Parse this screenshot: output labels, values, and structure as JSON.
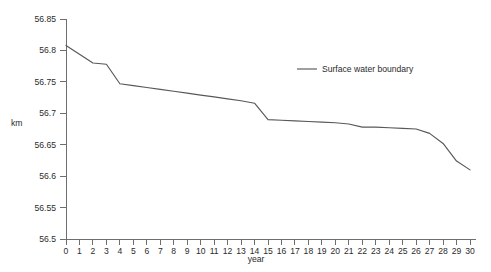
{
  "chart_data": {
    "type": "line",
    "title": "",
    "xlabel": "year",
    "ylabel": "km",
    "xlim": [
      0,
      30
    ],
    "ylim": [
      56.5,
      56.85
    ],
    "grid": false,
    "legend_position": "upper-right-inside",
    "x_ticks": [
      0,
      1,
      2,
      3,
      4,
      5,
      6,
      7,
      8,
      9,
      10,
      11,
      12,
      13,
      14,
      15,
      16,
      17,
      18,
      19,
      20,
      21,
      22,
      23,
      24,
      25,
      26,
      27,
      28,
      29,
      30
    ],
    "x_tick_labels": [
      "0",
      "1",
      "2",
      "3",
      "4",
      "5",
      "6",
      "7",
      "8",
      "9",
      "10",
      "11",
      "12",
      "13",
      "14",
      "15",
      "16",
      "17",
      "18",
      "19",
      "20",
      "21",
      "22",
      "23",
      "24",
      "25",
      "26",
      "27",
      "28",
      "29",
      "30"
    ],
    "y_ticks": [
      56.5,
      56.55,
      56.6,
      56.65,
      56.7,
      56.75,
      56.8,
      56.85
    ],
    "y_tick_labels": [
      "56.5",
      "56.55",
      "56.6",
      "56.65",
      "56.7",
      "56.75",
      "56.8",
      "56.85"
    ],
    "series": [
      {
        "name": "Surface water boundary",
        "color": "#58585a",
        "x": [
          0,
          1,
          2,
          3,
          4,
          5,
          6,
          7,
          8,
          9,
          10,
          11,
          12,
          13,
          14,
          15,
          16,
          17,
          18,
          19,
          20,
          21,
          22,
          23,
          24,
          25,
          26,
          27,
          28,
          29,
          30
        ],
        "values": [
          56.808,
          56.794,
          56.78,
          56.778,
          56.747,
          56.744,
          56.741,
          56.738,
          56.735,
          56.732,
          56.729,
          56.726,
          56.723,
          56.72,
          56.716,
          56.69,
          56.689,
          56.688,
          56.687,
          56.686,
          56.685,
          56.683,
          56.678,
          56.678,
          56.677,
          56.676,
          56.675,
          56.668,
          56.652,
          56.624,
          56.61
        ]
      }
    ],
    "annotations": []
  },
  "legend": {
    "entries": [
      {
        "label": "Surface water boundary",
        "color": "#58585a"
      }
    ]
  },
  "axes": {
    "y_axis_title": "km",
    "x_axis_title": "year"
  },
  "caption": {
    "text": ""
  }
}
